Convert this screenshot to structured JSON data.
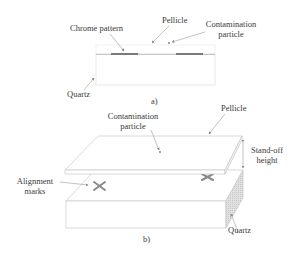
{
  "figure_a": {
    "caption": "a)",
    "labels": {
      "chrome_pattern": "Chrome pattern",
      "pellicle": "Pellicle",
      "contamination_line1": "Contamination",
      "contamination_line2": "particle",
      "quartz": "Quartz"
    }
  },
  "figure_b": {
    "caption": "b)",
    "labels": {
      "pellicle": "Pellicle",
      "contamination_line1": "Contamination",
      "contamination_line2": "particle",
      "standoff_line1": "Stand-off",
      "standoff_line2": "height",
      "alignment_line1": "Alignment",
      "alignment_line2": "marks",
      "quartz": "Quartz"
    }
  },
  "colors": {
    "line": "#9a9a9a",
    "chrome": "#7a7a7a",
    "mark": "#8a8a8a",
    "quartz_side": "#d4d4d4"
  }
}
